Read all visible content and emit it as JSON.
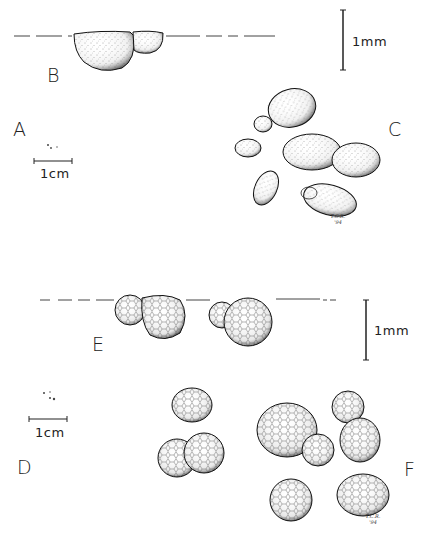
{
  "figure": {
    "panels": {
      "A": {
        "label": "A",
        "scale_label": "1cm",
        "description": "specimens at natural size (tiny dots)"
      },
      "B": {
        "label": "B",
        "description": "side view of budding cell on surface line, stippled"
      },
      "C": {
        "label": "C",
        "description": "group of stippled ovoid budding cells"
      },
      "D": {
        "label": "D",
        "scale_label": "1cm",
        "description": "specimens at natural size (tiny dots)"
      },
      "E": {
        "label": "E",
        "description": "side view of two budding reticulate cells on surface line"
      },
      "F": {
        "label": "F",
        "description": "group of reticulate budding cells"
      }
    },
    "scale_bars": {
      "top": {
        "label": "1mm"
      },
      "bottom": {
        "label": "1mm"
      }
    },
    "signatures": {
      "top": {
        "line1": "T.C.R.",
        "line2": "'94"
      },
      "bottom": {
        "line1": "T.C.R.",
        "line2": "'94"
      }
    },
    "colors": {
      "ink": "#1a1a1a",
      "background": "#ffffff"
    }
  }
}
